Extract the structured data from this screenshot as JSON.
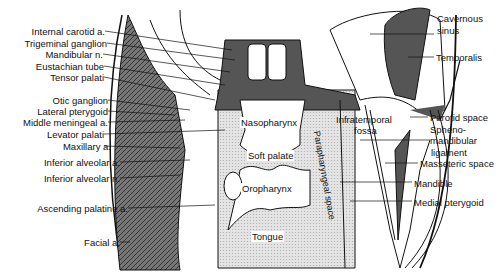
{
  "figure": {
    "type": "anatomical cross-section",
    "left_labels": [
      {
        "text": "Internal carotid a.",
        "y": 31
      },
      {
        "text": "Trigeminal ganglion",
        "y": 43
      },
      {
        "text": "Mandibular n.",
        "y": 54
      },
      {
        "text": "Eustachian tube",
        "y": 66
      },
      {
        "text": "Tensor palati",
        "y": 77
      },
      {
        "text": "Otic ganglion",
        "y": 100
      },
      {
        "text": "Lateral pterygoid",
        "y": 111
      },
      {
        "text": "Middle meningeal a.",
        "y": 122
      },
      {
        "text": "Levator palati",
        "y": 134
      },
      {
        "text": "Maxillary a.",
        "y": 146
      },
      {
        "text": "Inferior alveolar a.",
        "y": 162
      },
      {
        "text": "Inferior alveolar n.",
        "y": 178
      },
      {
        "text": "Ascending palatine a.",
        "y": 208
      },
      {
        "text": "Facial a.",
        "y": 242
      }
    ],
    "right_labels": [
      {
        "text": "Cavernous",
        "y": 18
      },
      {
        "text": "sinus",
        "y": 29
      },
      {
        "text": "Temporalis",
        "y": 53
      },
      {
        "text": "Parotid space",
        "y": 113
      },
      {
        "text": "Spheno-",
        "y": 125
      },
      {
        "text": "mandibular",
        "y": 136
      },
      {
        "text": "ligament",
        "y": 148
      },
      {
        "text": "Masseteric space",
        "y": 160
      },
      {
        "text": "Mandible",
        "y": 180
      },
      {
        "text": "Medial pterygoid",
        "y": 199
      }
    ],
    "inner_labels": {
      "nasopharynx": "Nasopharynx",
      "soft_palate": "Soft palate",
      "oropharynx": "Oropharynx",
      "tongue": "Tongue",
      "infratemporal_1": "Infratemporal",
      "infratemporal_2": "fossa",
      "parapharyngeal": "Parapharyngeal space"
    }
  }
}
